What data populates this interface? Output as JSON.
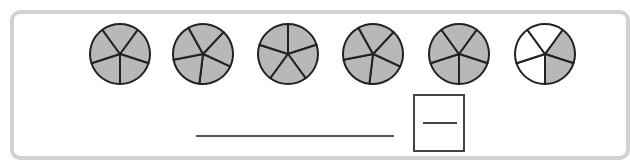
{
  "worksheet": {
    "task": "mixed-number-from-fraction-circles",
    "colors": {
      "shaded": "#b8b8b8",
      "unshaded": "#ffffff",
      "outline": "#222222",
      "frame": "#d2d2d2"
    },
    "circles": [
      {
        "parts": 5,
        "shaded": 5
      },
      {
        "parts": 5,
        "shaded": 5
      },
      {
        "parts": 5,
        "shaded": 5
      },
      {
        "parts": 5,
        "shaded": 5
      },
      {
        "parts": 5,
        "shaded": 5
      },
      {
        "parts": 5,
        "shaded": 2
      }
    ],
    "answer": {
      "whole_number": "",
      "numerator": "",
      "denominator": ""
    }
  }
}
